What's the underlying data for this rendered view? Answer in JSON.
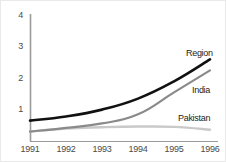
{
  "chart_data": {
    "type": "line",
    "title": "",
    "subtitle": "",
    "xlabel": "",
    "ylabel": "",
    "x": [
      1991,
      1992,
      1993,
      1994,
      1995,
      1996
    ],
    "xtick_labels": [
      "1991",
      "1992",
      "1993",
      "1994",
      "1995",
      "1996"
    ],
    "ytick_labels": [
      "1",
      "2",
      "3",
      "4"
    ],
    "yticks": [
      1,
      2,
      3,
      4
    ],
    "xlim": [
      1991,
      1996
    ],
    "ylim": [
      0,
      4
    ],
    "grid": false,
    "legend_position": "inline-right-of-line-end",
    "series": [
      {
        "name": "Region",
        "color": "#111111",
        "width": 2.6,
        "values": [
          0.65,
          0.78,
          1.0,
          1.35,
          1.9,
          2.6
        ]
      },
      {
        "name": "India",
        "color": "#8a8a8a",
        "width": 2.2,
        "values": [
          0.3,
          0.42,
          0.56,
          0.85,
          1.55,
          2.25
        ]
      },
      {
        "name": "Pakistan",
        "color": "#c9c9c9",
        "width": 2.4,
        "values": [
          0.3,
          0.4,
          0.44,
          0.46,
          0.45,
          0.36
        ]
      }
    ],
    "annotations": [
      {
        "text": "Region",
        "series": "Region"
      },
      {
        "text": "India",
        "series": "India"
      },
      {
        "text": "Pakistan",
        "series": "Pakistan"
      }
    ],
    "axis_color": "#9a9a9a"
  },
  "ytick_positions": [
    110,
    78.5,
    47,
    15.5
  ],
  "xtick_positions": [
    30,
    66,
    102,
    138,
    174,
    210
  ],
  "series_label_positions": [
    {
      "left": 186,
      "top": 48
    },
    {
      "left": 192,
      "top": 85
    },
    {
      "left": 178,
      "top": 113
    }
  ]
}
